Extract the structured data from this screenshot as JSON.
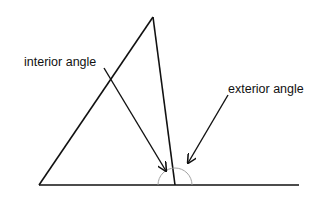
{
  "diagram": {
    "labels": {
      "interior": "interior angle",
      "exterior": "exterior angle"
    },
    "colors": {
      "line": "#111111",
      "arc": "#999999",
      "background": "#ffffff"
    },
    "points": {
      "apex": [
        153,
        17
      ],
      "bottom_left": [
        39,
        185
      ],
      "vertex": [
        175,
        185
      ],
      "baseline_end": [
        299,
        185
      ]
    },
    "arc": {
      "center": [
        175,
        185
      ],
      "radius": 17
    }
  }
}
